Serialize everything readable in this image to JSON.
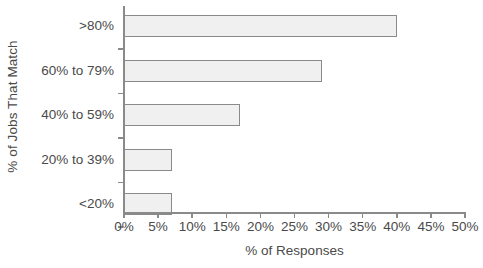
{
  "chart_data": {
    "type": "bar",
    "orientation": "horizontal",
    "title": "",
    "xlabel": "% of Responses",
    "ylabel": "% of Jobs That Match",
    "categories": [
      ">80%",
      "60% to 79%",
      "40% to 59%",
      "20% to 39%",
      "<20%"
    ],
    "values": [
      40,
      29,
      17,
      7,
      7
    ],
    "xlim": [
      0,
      50
    ],
    "xticks": [
      0,
      5,
      10,
      15,
      20,
      25,
      30,
      35,
      40,
      45,
      50
    ],
    "xtick_labels": [
      "0%",
      "5%",
      "10%",
      "15%",
      "20%",
      "25%",
      "30%",
      "35%",
      "40%",
      "45%",
      "50%"
    ],
    "grid": false,
    "legend": null,
    "bar_fill_color": "#f0f0f0",
    "bar_border_color": "#8a8a8a",
    "text_color": "#4a4a4a",
    "background_color": "#ffffff"
  }
}
